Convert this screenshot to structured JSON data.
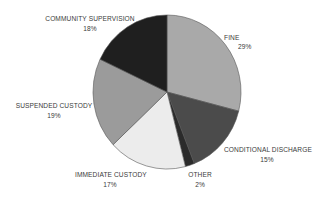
{
  "chart_data": {
    "type": "pie",
    "title": "",
    "start_angle": "12 o'clock",
    "direction": "clockwise",
    "categories": [
      "FINE",
      "CONDITIONAL DISCHARGE",
      "OTHER",
      "IMMEDIATE CUSTODY",
      "SUSPENDED CUSTODY",
      "COMMUNITY SUPERVISION"
    ],
    "values": [
      29,
      15,
      2,
      17,
      19,
      18
    ],
    "unit": "%",
    "colors": [
      "#a9a9a9",
      "#4b4b4b",
      "#2b2b2b",
      "#ececec",
      "#9b9b9b",
      "#1f1f1f"
    ],
    "legend": "none (direct labels)"
  },
  "labels": {
    "fine": {
      "name": "FINE",
      "pct": "29%"
    },
    "conditional_discharge": {
      "name": "CONDITIONAL DISCHARGE",
      "pct": "15%"
    },
    "other": {
      "name": "OTHER",
      "pct": "2%"
    },
    "immediate_custody": {
      "name": "IMMEDIATE CUSTODY",
      "pct": "17%"
    },
    "suspended_custody": {
      "name": "SUSPENDED CUSTODY",
      "pct": "19%"
    },
    "community_supervision": {
      "name": "COMMUNITY SUPERVISION",
      "pct": "18%"
    }
  }
}
